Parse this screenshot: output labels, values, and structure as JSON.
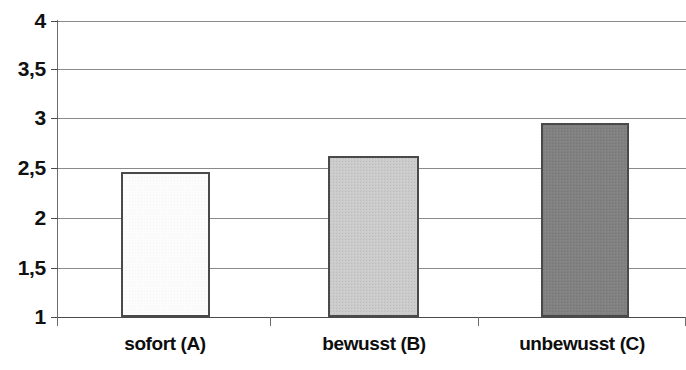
{
  "chart_data": {
    "type": "bar",
    "title": "",
    "subtitle": "",
    "xlabel": "",
    "ylabel": "",
    "categories": [
      "sofort (A)",
      "bewusst (B)",
      "unbewusst (C)"
    ],
    "values": [
      2.47,
      2.63,
      2.97
    ],
    "series": [
      {
        "name": "",
        "values": [
          2.47,
          2.63,
          2.97
        ]
      }
    ],
    "ylim": [
      1,
      4
    ],
    "yticks": [
      1,
      1.5,
      2,
      2.5,
      3,
      3.5,
      4
    ],
    "ytick_labels": [
      "1",
      "1,5",
      "2",
      "2,5",
      "3",
      "3,5",
      "4"
    ],
    "grid": true,
    "legend": false,
    "legend_position": "none",
    "annotations": [],
    "bar_colors": [
      "#fafafa",
      "#c8c8c8",
      "#808080"
    ],
    "bar_border_color": "#4a4a4a",
    "gridline_color": "#8a8a8a",
    "background_color": "#ffffff",
    "text_color": "#111111"
  },
  "axes": {
    "y_ticks": [
      {
        "label": "4",
        "value": 4
      },
      {
        "label": "3,5",
        "value": 3.5
      },
      {
        "label": "3",
        "value": 3
      },
      {
        "label": "2,5",
        "value": 2.5
      },
      {
        "label": "2",
        "value": 2
      },
      {
        "label": "1,5",
        "value": 1.5
      },
      {
        "label": "1",
        "value": 1
      }
    ],
    "x_categories": [
      {
        "label": "sofort (A)",
        "value": 2.47
      },
      {
        "label": "bewusst (B)",
        "value": 2.63
      },
      {
        "label": "unbewusst (C)",
        "value": 2.97
      }
    ]
  }
}
